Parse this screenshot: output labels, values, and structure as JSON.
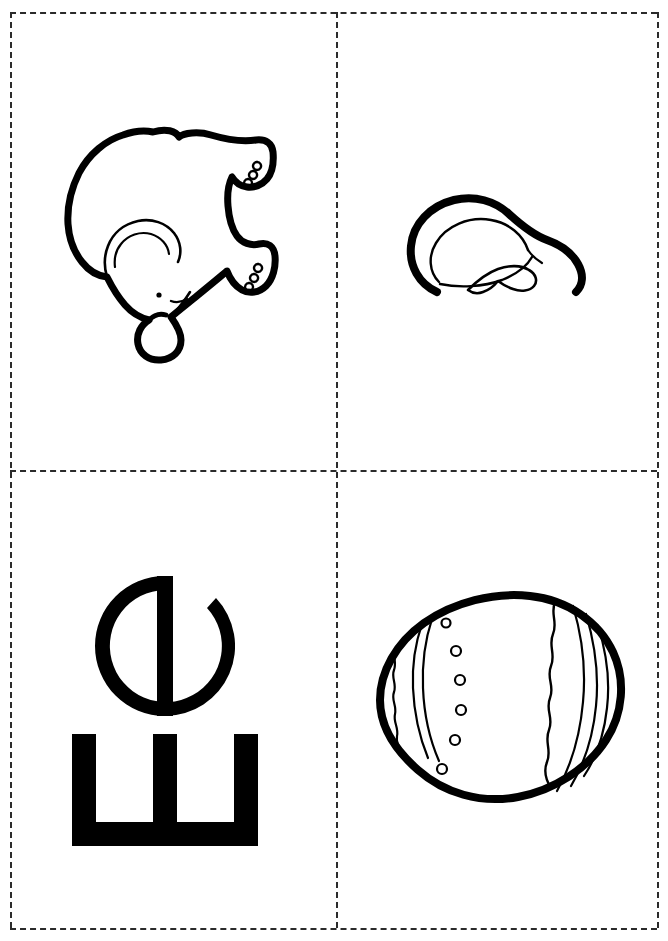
{
  "page": {
    "sheet_width": 668,
    "sheet_height": 941,
    "background_color": "#ffffff",
    "ink_color": "#000000",
    "cut_line_color": "#2b2b2b",
    "cut_line_style": "dashed",
    "grid": {
      "columns": 2,
      "rows": 2
    }
  },
  "cards": [
    {
      "id": "elephant",
      "position": "top-left",
      "kind": "picture",
      "subject": "elephant",
      "alt_text": "Outline drawing of an elephant, rotated on its side",
      "rotation_degrees": 90,
      "style": "black outline coloring page"
    },
    {
      "id": "ear",
      "position": "top-right",
      "kind": "picture",
      "subject": "ear",
      "alt_text": "Outline drawing of a human ear, rotated",
      "rotation_degrees": 90,
      "style": "black outline coloring page"
    },
    {
      "id": "letter",
      "position": "bottom-left",
      "kind": "letters",
      "uppercase": "E",
      "lowercase": "e",
      "pair_label": "Ee",
      "alt_text": "Capital E above lowercase e, both rotated a quarter turn",
      "rotation_degrees": -90,
      "style": "solid black bold letterforms"
    },
    {
      "id": "egg",
      "position": "bottom-right",
      "kind": "picture",
      "subject": "egg",
      "alt_text": "Outline drawing of a decorated Easter egg lying on its side",
      "rotation_degrees": 90,
      "decorations": {
        "dot_count": 6,
        "wavy_bands": 2,
        "thin_stripes": 3
      },
      "style": "black outline coloring page"
    }
  ]
}
